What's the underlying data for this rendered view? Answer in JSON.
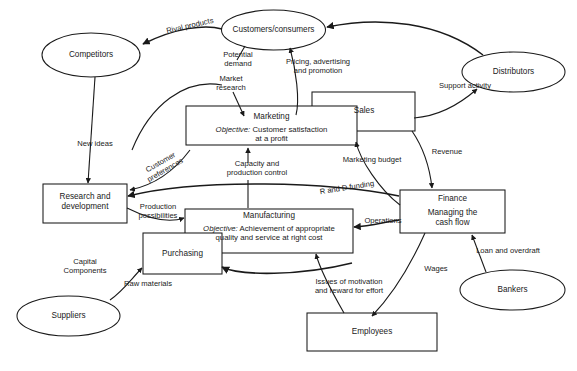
{
  "diagram": {
    "background": "#ffffff",
    "stroke": "#1a1a1a",
    "nodes": {
      "competitors": {
        "label": "Competitors",
        "shape": "ellipse"
      },
      "customers": {
        "label": "Customers/consumers",
        "shape": "ellipse"
      },
      "distributors": {
        "label": "Distributors",
        "shape": "ellipse"
      },
      "suppliers": {
        "label": "Suppliers",
        "shape": "ellipse"
      },
      "bankers": {
        "label": "Bankers",
        "shape": "ellipse"
      },
      "marketing": {
        "label": "Marketing",
        "objective_lead": "Objective:",
        "objective_line1": " Customer satisfaction",
        "objective_line2": "at a profit",
        "shape": "rect"
      },
      "sales": {
        "label": "Sales",
        "shape": "rect"
      },
      "research": {
        "line1": "Research and",
        "line2": "development",
        "shape": "rect"
      },
      "manufacturing": {
        "label": "Manufacturing",
        "objective_lead": "Objective:",
        "objective_line1": " Achievement of appropriate",
        "objective_line2": "quality and service at right cost",
        "shape": "rect"
      },
      "purchasing": {
        "label": "Purchasing",
        "shape": "rect"
      },
      "finance": {
        "line1": "Finance",
        "line2": "Managing the",
        "line3": "cash flow",
        "shape": "rect"
      },
      "employees": {
        "label": "Employees",
        "shape": "rect"
      }
    },
    "edges": {
      "rival_products": {
        "label": "Rival products",
        "from": "customers",
        "to": "competitors"
      },
      "potential_demand": {
        "line1": "Potential",
        "line2": "demand",
        "from": "customers",
        "to": "market_research"
      },
      "market_research": {
        "line1": "Market",
        "line2": "research",
        "from": "customers",
        "to": "marketing"
      },
      "pricing": {
        "line1": "Pricing, advertising",
        "line2": "and promotion",
        "from": "marketing",
        "to": "customers"
      },
      "support_activity": {
        "label": "Support activity",
        "from": "sales",
        "to": "distributors"
      },
      "new_ideas": {
        "label": "New ideas",
        "from": "competitors",
        "to": "research"
      },
      "customer_preferences": {
        "line1": "Customer",
        "line2": "preferences",
        "from": "marketing",
        "to": "research"
      },
      "capacity": {
        "line1": "Capacity and",
        "line2": "production control",
        "from": "manufacturing",
        "to": "marketing"
      },
      "marketing_budget": {
        "label": "Marketing budget",
        "from": "finance",
        "to": "marketing"
      },
      "revenue": {
        "label": "Revenue",
        "from": "sales",
        "to": "finance"
      },
      "rd_funding": {
        "label": "R and D funding",
        "from": "finance",
        "to": "research"
      },
      "operations": {
        "label": "Operations",
        "from": "finance",
        "to": "manufacturing"
      },
      "production_possibilities": {
        "line1": "Production",
        "line2": "possibilities",
        "from": "research",
        "to": "manufacturing"
      },
      "capital_components": {
        "line1": "Capital",
        "line2": "Components",
        "from": "suppliers",
        "to": "purchasing"
      },
      "raw_materials": {
        "label": "Raw materials",
        "from": "suppliers",
        "to": "purchasing"
      },
      "manufacturing_to_purchasing": {
        "label": "",
        "from": "manufacturing",
        "to": "purchasing"
      },
      "wages": {
        "label": "Wages",
        "from": "finance",
        "to": "employees"
      },
      "motivation": {
        "line1": "Issues of motivation",
        "line2": "and reward for effort",
        "from": "employees",
        "to": "manufacturing"
      },
      "loan_overdraft": {
        "label": "Loan and overdraft",
        "from": "bankers",
        "to": "finance"
      }
    }
  }
}
